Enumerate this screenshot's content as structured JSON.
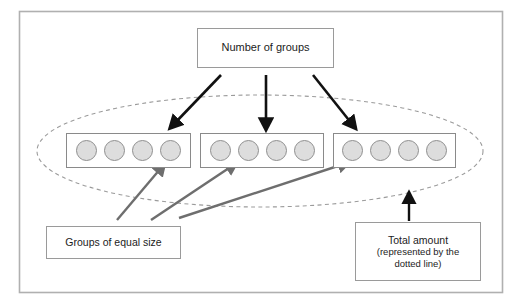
{
  "diagram": {
    "title_box": {
      "label": "Number of groups"
    },
    "groups_label_box": {
      "label": "Groups of equal size"
    },
    "total_label_box": {
      "line1": "Total amount",
      "line2": "(represented by the",
      "line3": "dotted line)"
    },
    "groups": [
      {
        "name": "group-1",
        "dots": 4
      },
      {
        "name": "group-2",
        "dots": 4
      },
      {
        "name": "group-3",
        "dots": 4
      }
    ],
    "totals": {
      "number_of_groups": 3,
      "items_per_group": 4,
      "total_items": 12
    },
    "colors": {
      "frame_border": "#b0b0b0",
      "box_border": "#9a9a9a",
      "group_border": "#8a8a8a",
      "dot_fill": "#dddddd",
      "dot_stroke": "#8f8f8f",
      "ellipse_stroke": "#9b9b9b",
      "black_arrow": "#111111",
      "gray_arrow": "#6e6e6e",
      "text": "#1c1c1c",
      "background": "#ffffff"
    },
    "ellipse": {
      "name": "total-amount-ellipse",
      "style": "dashed",
      "cx": 260,
      "cy": 151,
      "rx": 223,
      "ry": 56
    },
    "black_arrows": [
      {
        "name": "arrow-to-group-1",
        "x1": 221,
        "y1": 75,
        "x2": 174,
        "y2": 124
      },
      {
        "name": "arrow-to-group-2",
        "x1": 266,
        "y1": 75,
        "x2": 266,
        "y2": 124
      },
      {
        "name": "arrow-to-group-3",
        "x1": 313,
        "y1": 75,
        "x2": 352,
        "y2": 124
      },
      {
        "name": "arrow-to-ellipse",
        "x1": 409,
        "y1": 221,
        "x2": 409,
        "y2": 198
      }
    ],
    "gray_arrows": [
      {
        "name": "arrow-groups-to-group-1",
        "x1": 117,
        "y1": 220,
        "x2": 161,
        "y2": 168
      },
      {
        "name": "arrow-groups-to-group-2",
        "x1": 151,
        "y1": 220,
        "x2": 232,
        "y2": 166
      },
      {
        "name": "arrow-groups-to-group-3",
        "x1": 179,
        "y1": 218,
        "x2": 344,
        "y2": 164
      }
    ]
  }
}
